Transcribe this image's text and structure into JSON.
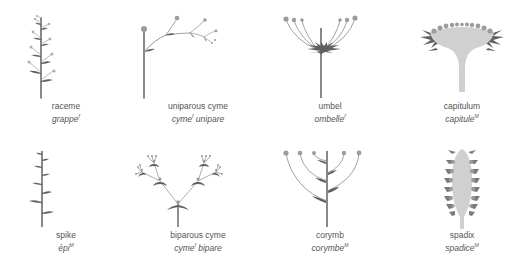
{
  "figure": {
    "colors": {
      "stem": "#6b6b6b",
      "flower": "#9c9c9c",
      "bract": "#5f5f5f",
      "receptacle": "#d0d0d0",
      "label_text": "#555555"
    },
    "items": [
      {
        "id": "raceme",
        "en": "raceme",
        "fr": "grappe",
        "gender": "f"
      },
      {
        "id": "uniparous-cyme",
        "en": "uniparous cyme",
        "fr": "cyme",
        "fr_rest": " unipare",
        "gender": "f"
      },
      {
        "id": "umbel",
        "en": "umbel",
        "fr": "ombelle",
        "gender": "f"
      },
      {
        "id": "capitulum",
        "en": "capitulum",
        "fr": "capitule",
        "gender": "M"
      },
      {
        "id": "spike",
        "en": "spike",
        "fr": "épi",
        "gender": "M"
      },
      {
        "id": "biparous-cyme",
        "en": "biparous cyme",
        "fr": "cyme",
        "fr_rest": " bipare",
        "gender": "f"
      },
      {
        "id": "corymb",
        "en": "corymb",
        "fr": "corymbe",
        "gender": "M"
      },
      {
        "id": "spadix",
        "en": "spadix",
        "fr": "spadice",
        "gender": "M"
      }
    ]
  }
}
